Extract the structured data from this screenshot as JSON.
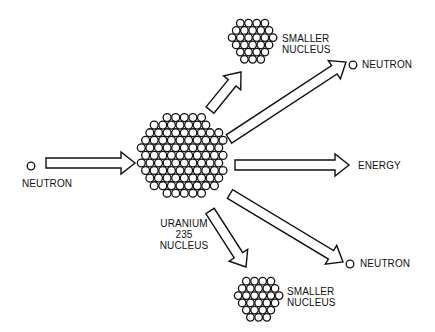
{
  "diagram": {
    "colors": {
      "stroke": "#111111",
      "fill": "#ffffff",
      "background": "#ffffff"
    },
    "input": {
      "particle": "neutron",
      "label": "NEUTRON"
    },
    "nucleus": {
      "line1": "URANIUM",
      "line2": "235",
      "line3": "NUCLEUS"
    },
    "products": {
      "smaller_nucleus_top": {
        "line1": "SMALLER",
        "line2": "NUCLEUS"
      },
      "neutron_top": {
        "label": "NEUTRON"
      },
      "energy": {
        "label": "ENERGY"
      },
      "neutron_bottom": {
        "label": "NEUTRON"
      },
      "smaller_nucleus_bottom": {
        "line1": "SMALLER",
        "line2": "NUCLEUS"
      }
    },
    "arrows": [
      {
        "name": "incoming-neutron-arrow",
        "from": [
          46,
          163
        ],
        "to": [
          135,
          163
        ]
      },
      {
        "name": "arrow-to-smaller-nucleus-top",
        "from": [
          210,
          110
        ],
        "to": [
          241,
          72
        ]
      },
      {
        "name": "arrow-to-neutron-top",
        "from": [
          229,
          139
        ],
        "to": [
          346,
          62
        ]
      },
      {
        "name": "arrow-to-energy",
        "from": [
          235,
          165
        ],
        "to": [
          349,
          165
        ]
      },
      {
        "name": "arrow-to-neutron-bottom",
        "from": [
          230,
          194
        ],
        "to": [
          343,
          262
        ]
      },
      {
        "name": "arrow-to-smaller-nucleus-bottom",
        "from": [
          210,
          211
        ],
        "to": [
          246,
          267
        ]
      }
    ]
  }
}
